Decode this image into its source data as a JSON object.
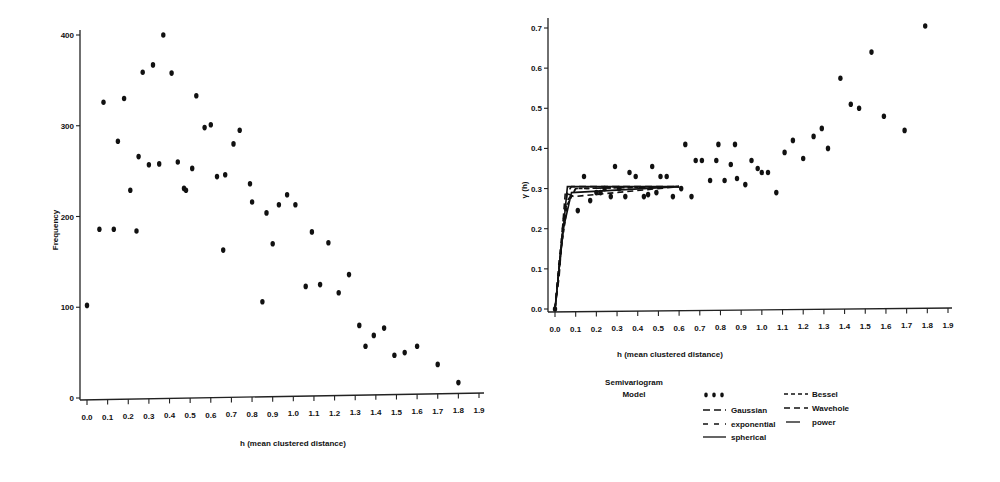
{
  "chart_data": [
    {
      "type": "scatter",
      "title": "",
      "xlabel": "h (mean clustered distance)",
      "ylabel": "Frequency",
      "xlim": [
        0.0,
        1.9
      ],
      "ylim": [
        0,
        400
      ],
      "xticks": [
        "0.0",
        "0.1",
        "0.2",
        "0.3",
        "0.4",
        "0.5",
        "0.6",
        "0.7",
        "0.8",
        "0.9",
        "1.0",
        "1.1",
        "1.2",
        "1.3",
        "1.4",
        "1.5",
        "1.6",
        "1.7",
        "1.8",
        "1.9"
      ],
      "yticks": [
        "0",
        "100",
        "200",
        "300",
        "400"
      ],
      "grid": false,
      "legend": null,
      "series": [
        {
          "name": "Frequency",
          "x": [
            0.0,
            0.06,
            0.08,
            0.13,
            0.15,
            0.18,
            0.21,
            0.24,
            0.25,
            0.27,
            0.3,
            0.32,
            0.35,
            0.37,
            0.41,
            0.44,
            0.47,
            0.48,
            0.51,
            0.53,
            0.57,
            0.6,
            0.63,
            0.66,
            0.67,
            0.71,
            0.74,
            0.79,
            0.8,
            0.85,
            0.87,
            0.9,
            0.93,
            0.97,
            1.01,
            1.06,
            1.09,
            1.13,
            1.17,
            1.22,
            1.27,
            1.32,
            1.35,
            1.39,
            1.44,
            1.49,
            1.54,
            1.6,
            1.7,
            1.8
          ],
          "y": [
            102,
            186,
            326,
            186,
            283,
            330,
            229,
            184,
            266,
            359,
            257,
            367,
            258,
            400,
            358,
            260,
            231,
            229,
            253,
            333,
            298,
            301,
            244,
            163,
            246,
            280,
            295,
            236,
            216,
            106,
            204,
            170,
            213,
            224,
            213,
            123,
            183,
            125,
            171,
            116,
            136,
            80,
            57,
            69,
            77,
            47,
            50,
            57,
            37,
            17
          ]
        }
      ]
    },
    {
      "type": "scatter",
      "title": "",
      "xlabel": "h (mean clustered distance)",
      "ylabel": "γ (h)",
      "xlim": [
        0.0,
        1.9
      ],
      "ylim": [
        0.0,
        0.7
      ],
      "xticks": [
        "0.0",
        "0.1",
        "0.2",
        "0.3",
        "0.4",
        "0.5",
        "0.6",
        "0.7",
        "0.8",
        "0.9",
        "1.0",
        "1.1",
        "1.2",
        "1.3",
        "1.4",
        "1.5",
        "1.6",
        "1.7",
        "1.8",
        "1.9"
      ],
      "yticks": [
        "0.0",
        "0.1",
        "0.2",
        "0.3",
        "0.4",
        "0.5",
        "0.6",
        "0.7"
      ],
      "grid": false,
      "legend": {
        "title": [
          "Semivariogram",
          "Model"
        ],
        "position": "bottom",
        "entries": [
          {
            "label": "",
            "style": "dots"
          },
          {
            "label": "Bessel",
            "style": "short-dash"
          },
          {
            "label": "Gaussian",
            "style": "long-dash"
          },
          {
            "label": "Wavehole",
            "style": "dash"
          },
          {
            "label": "exponential",
            "style": "medium-dash"
          },
          {
            "label": "power",
            "style": "short-solid"
          },
          {
            "label": "spherical",
            "style": "solid"
          }
        ]
      },
      "series": [
        {
          "name": "Semivariogram",
          "style": "points",
          "x": [
            0.0,
            0.11,
            0.14,
            0.17,
            0.2,
            0.22,
            0.24,
            0.27,
            0.29,
            0.31,
            0.34,
            0.36,
            0.39,
            0.43,
            0.45,
            0.47,
            0.49,
            0.51,
            0.54,
            0.57,
            0.61,
            0.63,
            0.66,
            0.68,
            0.71,
            0.75,
            0.78,
            0.79,
            0.82,
            0.85,
            0.87,
            0.88,
            0.92,
            0.95,
            0.98,
            1.0,
            1.03,
            1.07,
            1.11,
            1.15,
            1.2,
            1.25,
            1.29,
            1.32,
            1.38,
            1.43,
            1.47,
            1.53,
            1.59,
            1.69,
            1.79
          ],
          "y": [
            0.0,
            0.245,
            0.33,
            0.27,
            0.29,
            0.29,
            0.3,
            0.28,
            0.355,
            0.3,
            0.28,
            0.34,
            0.33,
            0.28,
            0.285,
            0.355,
            0.29,
            0.33,
            0.33,
            0.28,
            0.3,
            0.41,
            0.28,
            0.37,
            0.37,
            0.32,
            0.37,
            0.41,
            0.32,
            0.36,
            0.41,
            0.325,
            0.31,
            0.37,
            0.35,
            0.34,
            0.34,
            0.29,
            0.39,
            0.42,
            0.375,
            0.43,
            0.45,
            0.4,
            0.575,
            0.51,
            0.5,
            0.64,
            0.48,
            0.445,
            0.705
          ]
        },
        {
          "name": "Gaussian",
          "style": "long-dash",
          "x": [
            0.0,
            0.02,
            0.04,
            0.06,
            0.08,
            0.6
          ],
          "y": [
            0.0,
            0.08,
            0.22,
            0.29,
            0.305,
            0.305
          ]
        },
        {
          "name": "exponential",
          "style": "medium-dash",
          "x": [
            0.0,
            0.02,
            0.04,
            0.06,
            0.1,
            0.6
          ],
          "y": [
            0.0,
            0.12,
            0.22,
            0.27,
            0.3,
            0.305
          ]
        },
        {
          "name": "spherical",
          "style": "solid",
          "x": [
            0.0,
            0.02,
            0.04,
            0.06,
            0.6
          ],
          "y": [
            0.0,
            0.1,
            0.2,
            0.305,
            0.305
          ]
        },
        {
          "name": "Bessel",
          "style": "short-dash",
          "x": [
            0.0,
            0.03,
            0.06,
            0.1,
            0.6
          ],
          "y": [
            0.0,
            0.15,
            0.26,
            0.3,
            0.305
          ]
        },
        {
          "name": "Wavehole",
          "style": "dash",
          "x": [
            0.0,
            0.03,
            0.05,
            0.09,
            0.6
          ],
          "y": [
            0.0,
            0.16,
            0.29,
            0.28,
            0.305
          ]
        },
        {
          "name": "power",
          "style": "short-solid",
          "x": [
            0.0,
            0.04,
            0.08,
            0.6
          ],
          "y": [
            0.0,
            0.2,
            0.29,
            0.305
          ]
        }
      ]
    }
  ],
  "labels": {
    "left": {
      "ylabel": "Frequency",
      "xlabel": "h (mean clustered distance)"
    },
    "right": {
      "ylabel": "γ (h)",
      "xlabel": "h (mean clustered distance)",
      "legend_title_1": "Semivariogram",
      "legend_title_2": "Model",
      "legend_dots": "• • •",
      "legend_gaussian": "Gaussian",
      "legend_exponential": "exponential",
      "legend_spherical": "spherical",
      "legend_bessel": "Bessel",
      "legend_wavehole": "Wavehole",
      "legend_power": "power"
    }
  }
}
